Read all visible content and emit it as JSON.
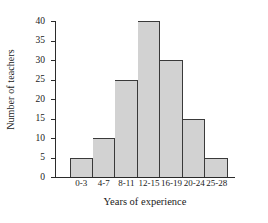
{
  "chart_data": {
    "type": "bar",
    "title": "",
    "subtitle": "",
    "xlabel": "Years of experience",
    "ylabel": "Number of teachers",
    "categories": [
      "0-3",
      "4-7",
      "8-11",
      "12-15",
      "16-19",
      "20-24",
      "25-28"
    ],
    "values": [
      5,
      10,
      25,
      40,
      30,
      15,
      5
    ],
    "ylim": [
      0,
      40
    ],
    "yticks": [
      0,
      5,
      10,
      15,
      20,
      25,
      30,
      35,
      40
    ],
    "ytick_labels": [
      "0",
      "5",
      "10",
      "15",
      "20",
      "25",
      "30",
      "35",
      "40"
    ],
    "grid": false,
    "legend": null,
    "legend_position": "none",
    "bar_fill_color": "#d2d2d2",
    "bar_edge_color": "#3a3a3a",
    "axis_color": "#2b2b2b",
    "background_color": "#ffffff",
    "annotations": []
  }
}
